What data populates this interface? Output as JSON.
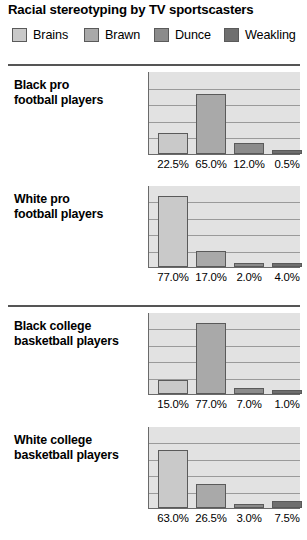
{
  "title": "Racial stereotyping by TV sportscasters",
  "legend": [
    {
      "label": "Brains",
      "color": "#c9c9c9"
    },
    {
      "label": "Brawn",
      "color": "#a9a9a9"
    },
    {
      "label": "Dunce",
      "color": "#8b8b8b"
    },
    {
      "label": "Weakling",
      "color": "#6f6f6f"
    }
  ],
  "panels": [
    {
      "label_line1": "Black pro",
      "label_line2": "football players",
      "values": [
        22.5,
        65.0,
        12.0,
        0.5
      ],
      "value_labels": [
        "22.5%",
        "65.0%",
        "12.0%",
        "0.5%"
      ]
    },
    {
      "label_line1": "White pro",
      "label_line2": "football players",
      "values": [
        77.0,
        17.0,
        2.0,
        4.0
      ],
      "value_labels": [
        "77.0%",
        "17.0%",
        "2.0%",
        "4.0%"
      ]
    },
    {
      "label_line1": "Black college",
      "label_line2": "basketball players",
      "values": [
        15.0,
        77.0,
        7.0,
        1.0
      ],
      "value_labels": [
        "15.0%",
        "77.0%",
        "7.0%",
        "1.0%"
      ]
    },
    {
      "label_line1": "White college",
      "label_line2": "basketball players",
      "values": [
        63.0,
        26.5,
        3.0,
        7.5
      ],
      "value_labels": [
        "63.0%",
        "26.5%",
        "3.0%",
        "7.5%"
      ]
    }
  ],
  "chart_data": {
    "type": "bar",
    "title": "Racial stereotyping by TV sportscasters",
    "xlabel": "",
    "ylabel": "",
    "ylim": [
      0,
      85
    ],
    "grid": true,
    "legend_position": "top",
    "categories": [
      "Brains",
      "Brawn",
      "Dunce",
      "Weakling"
    ],
    "panels": [
      {
        "name": "Black pro football players",
        "values": [
          22.5,
          65.0,
          12.0,
          0.5
        ]
      },
      {
        "name": "White pro football players",
        "values": [
          77.0,
          17.0,
          2.0,
          4.0
        ]
      },
      {
        "name": "Black college basketball players",
        "values": [
          15.0,
          77.0,
          7.0,
          1.0
        ]
      },
      {
        "name": "White college basketball players",
        "values": [
          63.0,
          26.5,
          3.0,
          7.5
        ]
      }
    ],
    "units": "percent"
  }
}
